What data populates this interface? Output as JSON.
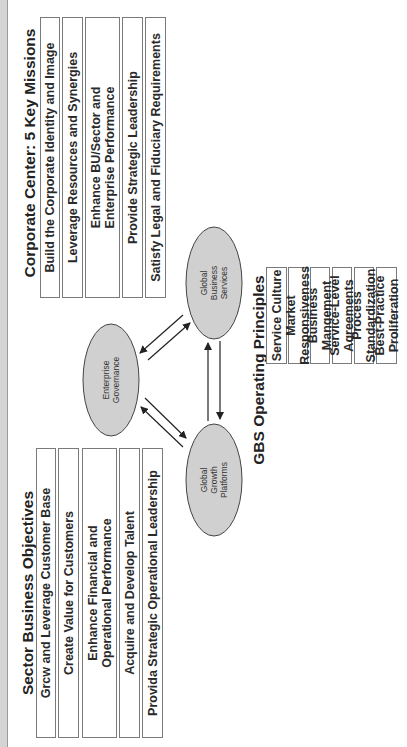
{
  "corporate_center": {
    "title": "Corporate Center: 5 Key Missions",
    "missions": [
      "Build the Corporate Identity and Image",
      "Leverage Resources and Synergies",
      "Enhance BU/Sector and\nEnterprise Performance",
      "Provide Strategic Leadership",
      "Satisfy Legal and Fiduciary Requirements"
    ]
  },
  "sector_business": {
    "title": "Sector Business Objectives",
    "objectives": [
      "Grcw and Leverage Customer Base",
      "Create Value for Customers",
      "Enhance Financial and\nOperational Performance",
      "Acquire and Develop Talent",
      "Provida Strategic Operational Leadership"
    ]
  },
  "gbs_principles": {
    "title": "GBS Operating Principles",
    "principles": [
      "Service Culture",
      "Market Responsiveness",
      "Business Mangement",
      "Service-Level Agreements",
      "Process Standardization",
      "Best-Practice Proliferation"
    ]
  },
  "nodes": {
    "enterprise_governance": "Enterprise\nGovernance",
    "global_business_services": "Global\nBusiness\nServices",
    "global_growth_platforms": "Global\nGrowth\nPlatforms"
  },
  "colors": {
    "ellipse_fill": "#d0d0d0",
    "band": "#d4d4d4",
    "box_border": "#7a7a7a"
  }
}
